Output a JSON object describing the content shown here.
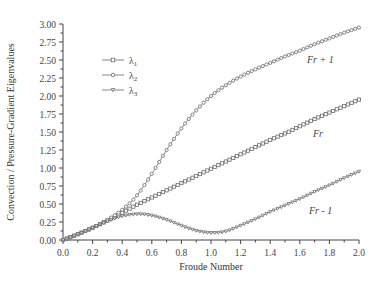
{
  "chart_data": {
    "type": "line",
    "title": "",
    "xlabel": "Froude Number",
    "ylabel": "Convection / Pressure-Gradient Eigenvalues",
    "xlim": [
      0.0,
      2.0
    ],
    "ylim": [
      0.0,
      3.0
    ],
    "grid": false,
    "legend_position": "upper-left",
    "x_ticks": [
      "0.0",
      "0.2",
      "0.4",
      "0.6",
      "0.8",
      "1.0",
      "1.2",
      "1.4",
      "1.6",
      "1.8",
      "2.0"
    ],
    "y_ticks": [
      "0.00",
      "0.25",
      "0.50",
      "0.75",
      "1.00",
      "1.25",
      "1.50",
      "1.75",
      "2.00",
      "2.25",
      "2.50",
      "2.75",
      "3.00"
    ],
    "x": [
      0.0,
      0.1,
      0.2,
      0.3,
      0.4,
      0.5,
      0.6,
      0.7,
      0.8,
      0.9,
      1.0,
      1.1,
      1.2,
      1.3,
      1.4,
      1.5,
      1.6,
      1.7,
      1.8,
      1.9,
      2.0
    ],
    "series": [
      {
        "name": "λ1",
        "marker": "square",
        "values": [
          0.0,
          0.08,
          0.17,
          0.27,
          0.38,
          0.49,
          0.59,
          0.69,
          0.79,
          0.89,
          0.99,
          1.09,
          1.19,
          1.29,
          1.39,
          1.48,
          1.58,
          1.68,
          1.77,
          1.86,
          1.95
        ]
      },
      {
        "name": "λ2",
        "marker": "circle",
        "values": [
          0.0,
          0.08,
          0.17,
          0.28,
          0.42,
          0.62,
          0.92,
          1.25,
          1.55,
          1.8,
          2.0,
          2.15,
          2.27,
          2.37,
          2.46,
          2.55,
          2.63,
          2.72,
          2.8,
          2.88,
          2.95
        ]
      },
      {
        "name": "λ3",
        "marker": "triangle-down",
        "values": [
          0.0,
          0.08,
          0.17,
          0.26,
          0.33,
          0.36,
          0.34,
          0.28,
          0.2,
          0.13,
          0.1,
          0.12,
          0.2,
          0.29,
          0.39,
          0.48,
          0.57,
          0.67,
          0.76,
          0.86,
          0.95
        ]
      }
    ],
    "annotations": [
      {
        "text": "Fr + 1",
        "x": 1.65,
        "y": 2.48
      },
      {
        "text": "Fr",
        "x": 1.68,
        "y": 1.33
      },
      {
        "text": "Fr - 1",
        "x": 1.66,
        "y": 0.42
      }
    ]
  },
  "labels": {
    "xlabel": "Froude Number",
    "ylabel": "Convection / Pressure-Gradient Eigenvalues",
    "legend": [
      "λ1",
      "λ2",
      "λ3"
    ],
    "annot_fr_plus_1": "Fr + 1",
    "annot_fr": "Fr",
    "annot_fr_minus_1": "Fr - 1"
  },
  "colors": {
    "axis": "#444444",
    "line": "#6b6b6b",
    "marker_fill": "#ffffff",
    "text": "#444444"
  }
}
